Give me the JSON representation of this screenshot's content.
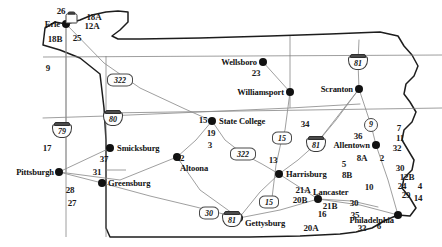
{
  "map": {
    "title": "Pennsylvania Highway Network Map",
    "region": "Pennsylvania",
    "background_color": "#ffffff",
    "line_color": "#8a8a8a",
    "border_color": "#222222",
    "text_color": "#1a1a1a"
  },
  "cities": [
    {
      "name": "Erie",
      "label_side": "left",
      "dot_x": 66,
      "dot_y": 24,
      "label_x": 60,
      "label_y": 24
    },
    {
      "name": "Wellsboro",
      "label_side": "left",
      "dot_x": 263,
      "dot_y": 62,
      "label_x": 257,
      "label_y": 62
    },
    {
      "name": "Williamsport",
      "label_side": "left",
      "dot_x": 290,
      "dot_y": 92,
      "label_x": 284,
      "label_y": 92
    },
    {
      "name": "Scranton",
      "label_side": "left",
      "dot_x": 359,
      "dot_y": 89,
      "label_x": 353,
      "label_y": 89
    },
    {
      "name": "State College",
      "label_side": "right",
      "dot_x": 212,
      "dot_y": 121,
      "label_x": 219,
      "label_y": 121
    },
    {
      "name": "Smicksburg",
      "label_side": "right",
      "dot_x": 110,
      "dot_y": 148,
      "label_x": 117,
      "label_y": 148
    },
    {
      "name": "Altoona",
      "label_side": "right",
      "dot_x": 177,
      "dot_y": 157,
      "label_x": 180,
      "label_y": 168
    },
    {
      "name": "Pittsburgh",
      "label_side": "left",
      "dot_x": 59,
      "dot_y": 172,
      "label_x": 54,
      "label_y": 172
    },
    {
      "name": "Greensburg",
      "label_side": "right",
      "dot_x": 102,
      "dot_y": 183,
      "label_x": 108,
      "label_y": 183
    },
    {
      "name": "Allentown",
      "label_side": "left",
      "dot_x": 376,
      "dot_y": 145,
      "label_x": 370,
      "label_y": 145
    },
    {
      "name": "Harrisburg",
      "label_side": "right",
      "dot_x": 279,
      "dot_y": 174,
      "label_x": 286,
      "label_y": 174
    },
    {
      "name": "Lancaster",
      "label_side": "right",
      "dot_x": 318,
      "dot_y": 199,
      "label_x": 313,
      "label_y": 192
    },
    {
      "name": "Gettysburg",
      "label_side": "right",
      "dot_x": 239,
      "dot_y": 218,
      "label_x": 245,
      "label_y": 223
    },
    {
      "name": "Philadelphia",
      "label_side": "left",
      "dot_x": 398,
      "dot_y": 215,
      "label_x": 394,
      "label_y": 220
    }
  ],
  "point_labels": [
    {
      "text": "26",
      "x": 61,
      "y": 11
    },
    {
      "text": "18A",
      "x": 94,
      "y": 17
    },
    {
      "text": "12A",
      "x": 92,
      "y": 26
    },
    {
      "text": "18B",
      "x": 55,
      "y": 39
    },
    {
      "text": "25",
      "x": 77,
      "y": 38
    },
    {
      "text": "9",
      "x": 48,
      "y": 68
    },
    {
      "text": "23",
      "x": 256,
      "y": 73
    },
    {
      "text": "15",
      "x": 203,
      "y": 120
    },
    {
      "text": "19",
      "x": 211,
      "y": 133
    },
    {
      "text": "3",
      "x": 210,
      "y": 145
    },
    {
      "text": "34",
      "x": 305,
      "y": 124
    },
    {
      "text": "13",
      "x": 273,
      "y": 160
    },
    {
      "text": "36",
      "x": 358,
      "y": 136
    },
    {
      "text": "7",
      "x": 399,
      "y": 128
    },
    {
      "text": "11",
      "x": 400,
      "y": 138
    },
    {
      "text": "32",
      "x": 397,
      "y": 148
    },
    {
      "text": "8A",
      "x": 362,
      "y": 158
    },
    {
      "text": "2",
      "x": 382,
      "y": 158
    },
    {
      "text": "5",
      "x": 344,
      "y": 164
    },
    {
      "text": "8B",
      "x": 347,
      "y": 175
    },
    {
      "text": "30",
      "x": 400,
      "y": 168
    },
    {
      "text": "12B",
      "x": 407,
      "y": 177
    },
    {
      "text": "24",
      "x": 402,
      "y": 186
    },
    {
      "text": "4",
      "x": 420,
      "y": 186
    },
    {
      "text": "29",
      "x": 406,
      "y": 195
    },
    {
      "text": "14",
      "x": 418,
      "y": 198
    },
    {
      "text": "10",
      "x": 369,
      "y": 187
    },
    {
      "text": "17",
      "x": 47,
      "y": 148
    },
    {
      "text": "37",
      "x": 104,
      "y": 159
    },
    {
      "text": "22",
      "x": 180,
      "y": 158
    },
    {
      "text": "31",
      "x": 97,
      "y": 172
    },
    {
      "text": "28",
      "x": 70,
      "y": 190
    },
    {
      "text": "27",
      "x": 72,
      "y": 203
    },
    {
      "text": "21A",
      "x": 303,
      "y": 190
    },
    {
      "text": "20B",
      "x": 300,
      "y": 200
    },
    {
      "text": "21B",
      "x": 330,
      "y": 206
    },
    {
      "text": "30",
      "x": 354,
      "y": 203
    },
    {
      "text": "16",
      "x": 322,
      "y": 214
    },
    {
      "text": "35",
      "x": 355,
      "y": 215
    },
    {
      "text": "6",
      "x": 379,
      "y": 226
    },
    {
      "text": "33",
      "x": 362,
      "y": 228
    },
    {
      "text": "20A",
      "x": 311,
      "y": 228
    },
    {
      "text": "1",
      "x": 231,
      "y": 220
    }
  ],
  "interstate_shields": [
    {
      "number": "79",
      "x": 62,
      "y": 130
    },
    {
      "number": "80",
      "x": 113,
      "y": 118
    },
    {
      "number": "81",
      "x": 358,
      "y": 62
    },
    {
      "number": "81",
      "x": 316,
      "y": 144
    },
    {
      "number": "81",
      "x": 232,
      "y": 219
    }
  ],
  "us_shields": [
    {
      "number": "322",
      "x": 120,
      "y": 80,
      "style": "wide"
    },
    {
      "number": "322",
      "x": 243,
      "y": 154,
      "style": "wide"
    },
    {
      "number": "30",
      "x": 209,
      "y": 213,
      "style": "narrow"
    },
    {
      "number": "15",
      "x": 282,
      "y": 138,
      "style": "narrow"
    },
    {
      "number": "15",
      "x": 269,
      "y": 202,
      "style": "narrow"
    }
  ],
  "circle_shields": [
    {
      "number": "9",
      "x": 371,
      "y": 125
    }
  ],
  "small_shield": {
    "number": "",
    "x": 72,
    "y": 18
  }
}
